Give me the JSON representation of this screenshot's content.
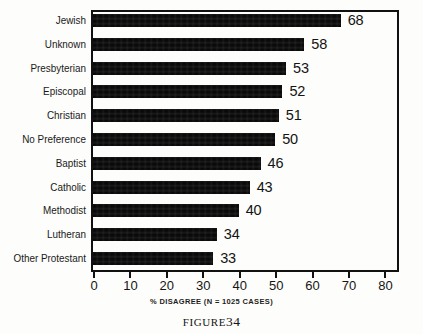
{
  "figure": {
    "caption_word": "FIGURE",
    "caption_number": "34"
  },
  "chart_data": {
    "type": "bar",
    "orientation": "horizontal",
    "title": "",
    "subtitle": "",
    "xlabel": "% DISAGREE (N = 1025 CASES)",
    "ylabel": "",
    "categories": [
      "Jewish",
      "Unknown",
      "Presbyterian",
      "Episcopal",
      "Christian",
      "No Preference",
      "Baptist",
      "Catholic",
      "Methodist",
      "Lutheran",
      "Other Protestant"
    ],
    "values": [
      68,
      58,
      53,
      52,
      51,
      50,
      46,
      43,
      40,
      34,
      33
    ],
    "value_labels": [
      "68",
      "58",
      "53",
      "52",
      "51",
      "50",
      "46",
      "43",
      "40",
      "34",
      "33"
    ],
    "xlim": [
      0,
      84
    ],
    "xticks": [
      0,
      10,
      20,
      30,
      40,
      50,
      60,
      70,
      80
    ],
    "xticklabels": [
      "0",
      "10",
      "20",
      "30",
      "40",
      "50",
      "60",
      "70",
      "80"
    ],
    "grid": false,
    "legend": false,
    "bar_color": "#0a0a0a",
    "frame_color": "#111111",
    "background": "#fdfdfb",
    "n_cases": 1025
  }
}
